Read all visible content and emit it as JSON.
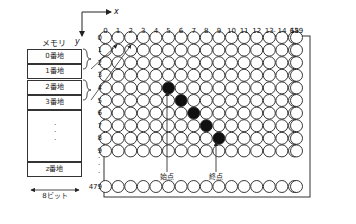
{
  "figure": {
    "type": "memory-to-pixel-grid-diagram",
    "axes": {
      "x_label": "x",
      "y_label": "y"
    }
  },
  "memory": {
    "title": "メモリ",
    "cells": [
      {
        "label": "0番地"
      },
      {
        "label": "1番地"
      },
      {
        "label": "2番地"
      },
      {
        "label": "3番地"
      },
      {
        "label": ""
      },
      {
        "label": "z番地"
      }
    ],
    "vertical_ellipsis": "·\n·\n·",
    "width_label": "8ビット"
  },
  "grid": {
    "column_labels": [
      "0",
      "1",
      "2",
      "3",
      "4",
      "5",
      "6",
      "7",
      "8",
      "9",
      "10",
      "11",
      "12",
      "13",
      "14",
      "15"
    ],
    "column_ellipsis": "···",
    "last_column_label": "639",
    "row_labels": [
      "0",
      "1",
      "2",
      "3",
      "4",
      "5",
      "6",
      "7",
      "8",
      "9"
    ],
    "row_ellipsis": "·\n·\n·",
    "last_row_label": "479",
    "filled_pixels": [
      {
        "x": 5,
        "y": 4
      },
      {
        "x": 6,
        "y": 5
      },
      {
        "x": 7,
        "y": 6
      },
      {
        "x": 8,
        "y": 7
      },
      {
        "x": 9,
        "y": 8
      }
    ],
    "colors": {
      "pixel_stroke": "#222222",
      "pixel_fill": "#ffffff",
      "pixel_filled": "#111111"
    }
  },
  "annotations": {
    "start_point": "始点",
    "end_point": "終点"
  }
}
